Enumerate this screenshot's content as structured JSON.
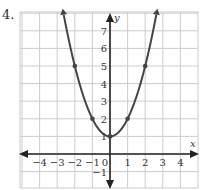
{
  "problem": {
    "number": "4."
  },
  "chart_data": {
    "type": "line",
    "title": "",
    "function": "y = x^2 + 1",
    "xlabel": "x",
    "ylabel": "y",
    "xlim": [
      -4.5,
      4.5
    ],
    "ylim": [
      -2,
      8
    ],
    "grid": true,
    "x_ticks": [
      "-4",
      "-3",
      "-2",
      "-1",
      "0",
      "1",
      "2",
      "3",
      "4"
    ],
    "y_ticks": [
      "-1",
      "1",
      "2",
      "3",
      "4",
      "5",
      "6",
      "7"
    ],
    "points": [
      {
        "x": -2,
        "y": 5
      },
      {
        "x": -1,
        "y": 2
      },
      {
        "x": 0,
        "y": 1
      },
      {
        "x": 1,
        "y": 2
      },
      {
        "x": 2,
        "y": 5
      }
    ],
    "colors": {
      "curve": "#444444",
      "axis": "#222222",
      "grid": "#cccccc"
    }
  }
}
